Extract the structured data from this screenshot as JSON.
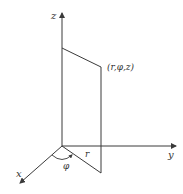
{
  "diagram": {
    "axes": {
      "x_label": "x",
      "y_label": "y",
      "z_label": "z"
    },
    "point_label": "(r,φ,z)",
    "radius_label": "r",
    "angle_label": "φ",
    "colors": {
      "line": "#3a3a3a",
      "text": "#333333",
      "background": "#ffffff"
    }
  }
}
